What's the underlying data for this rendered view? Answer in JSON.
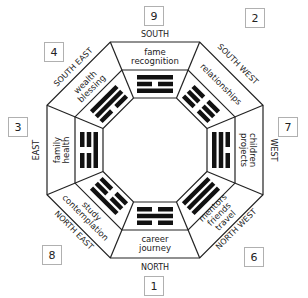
{
  "diagram": {
    "type": "bagua-map",
    "areas": [
      {
        "id": "south",
        "direction": "SOUTH",
        "number": "9",
        "aspects": [
          "fame",
          "recognition"
        ],
        "trigram": [
          "solid",
          "broken",
          "solid"
        ]
      },
      {
        "id": "southwest",
        "direction": "SOUTH WEST",
        "number": "2",
        "aspects": [
          "relationships"
        ],
        "trigram": [
          "broken",
          "broken",
          "broken"
        ]
      },
      {
        "id": "west",
        "direction": "WEST",
        "number": "7",
        "aspects": [
          "children",
          "projects"
        ],
        "trigram": [
          "broken",
          "solid",
          "solid"
        ]
      },
      {
        "id": "northwest",
        "direction": "NORTH WEST",
        "number": "6",
        "aspects": [
          "mentors",
          "friends",
          "travel"
        ],
        "trigram": [
          "solid",
          "solid",
          "solid"
        ]
      },
      {
        "id": "north",
        "direction": "NORTH",
        "number": "1",
        "aspects": [
          "career",
          "journey"
        ],
        "trigram": [
          "broken",
          "solid",
          "broken"
        ]
      },
      {
        "id": "northeast",
        "direction": "NORTH EAST",
        "number": "8",
        "aspects": [
          "study",
          "contemplation"
        ],
        "trigram": [
          "solid",
          "broken",
          "broken"
        ]
      },
      {
        "id": "east",
        "direction": "EAST",
        "number": "3",
        "aspects": [
          "family",
          "health"
        ],
        "trigram": [
          "broken",
          "broken",
          "solid"
        ]
      },
      {
        "id": "southeast",
        "direction": "SOUTH EAST",
        "number": "4",
        "aspects": [
          "wealth",
          "blessing"
        ],
        "trigram": [
          "solid",
          "solid",
          "broken"
        ]
      }
    ],
    "colors": {
      "line": "#222222",
      "trigram": "#111111",
      "box_border": "#b0b0b0",
      "background": "#ffffff"
    }
  },
  "labels": {
    "south": "SOUTH",
    "southwest": "SOUTH WEST",
    "west": "WEST",
    "northwest": "NORTH WEST",
    "north": "NORTH",
    "northeast": "NORTH EAST",
    "east": "EAST",
    "southeast": "SOUTH EAST"
  },
  "numbers": {
    "south": "9",
    "southwest": "2",
    "west": "7",
    "northwest": "6",
    "north": "1",
    "northeast": "8",
    "east": "3",
    "southeast": "4"
  },
  "aspects": {
    "south_1": "fame",
    "south_2": "recognition",
    "southwest_1": "relationships",
    "west_1": "children",
    "west_2": "projects",
    "northwest_1": "mentors",
    "northwest_2": "friends",
    "northwest_3": "travel",
    "north_1": "career",
    "north_2": "journey",
    "northeast_1": "study",
    "northeast_2": "contemplation",
    "east_1": "family",
    "east_2": "health",
    "southeast_1": "wealth",
    "southeast_2": "blessing"
  }
}
